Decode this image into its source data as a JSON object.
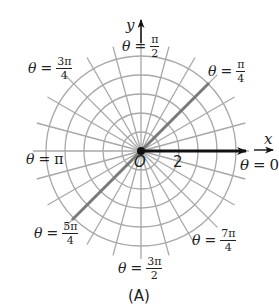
{
  "diagram": {
    "type": "polar-grid",
    "center": {
      "x": 141,
      "y": 151
    },
    "ring_count": 5,
    "ring_spacing_px": 19,
    "radial_step": "π/12",
    "colors": {
      "grid": "#a8a8a8",
      "highlight_ray": "#7a7a7a",
      "polar_axis": "#111111",
      "text": "#222222"
    },
    "highlight_rays": [
      "π/4",
      "5π/4"
    ]
  },
  "axes": {
    "x_label": "x",
    "y_label": "y",
    "origin_label": "O",
    "tick_label": "2"
  },
  "angle_labels": [
    {
      "id": "pi-over-2",
      "theta": "θ",
      "eq": "=",
      "num": "π",
      "den": "2"
    },
    {
      "id": "3pi-over-4",
      "theta": "θ",
      "eq": "=",
      "num": "3π",
      "den": "4"
    },
    {
      "id": "pi-over-4",
      "theta": "θ",
      "eq": "=",
      "num": "π",
      "den": "4"
    },
    {
      "id": "pi",
      "theta": "θ",
      "eq": "=",
      "value": "π"
    },
    {
      "id": "zero",
      "theta": "θ",
      "eq": "=",
      "value": "0"
    },
    {
      "id": "5pi-over-4",
      "theta": "θ",
      "eq": "=",
      "num": "5π",
      "den": "4"
    },
    {
      "id": "3pi-over-2",
      "theta": "θ",
      "eq": "=",
      "num": "3π",
      "den": "2"
    },
    {
      "id": "7pi-over-4",
      "theta": "θ",
      "eq": "=",
      "num": "7π",
      "den": "4"
    }
  ],
  "caption": "(A)"
}
